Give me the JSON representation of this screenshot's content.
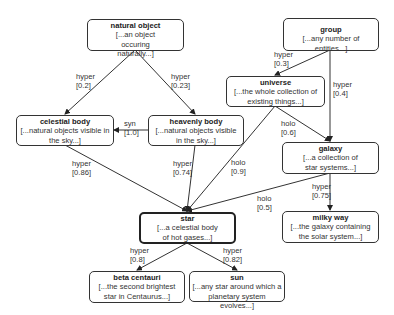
{
  "nodes": {
    "natural_object": {
      "title": "natural object",
      "gloss": "[...an object occuring naturally...]"
    },
    "celestial_body": {
      "title": "celestial body",
      "gloss": "[...natural objects visible in the sky...]"
    },
    "heavenly_body": {
      "title": "heavenly body",
      "gloss": "[...natural objects visible in the sky...]"
    },
    "group": {
      "title": "group",
      "gloss": "[...any number of entities...]"
    },
    "universe": {
      "title": "universe",
      "gloss": "[...the whole collection of existing things...]"
    },
    "galaxy": {
      "title": "galaxy",
      "gloss": "[...a collection of star systems...]"
    },
    "star": {
      "title": "star",
      "gloss": "[...a celestial body of hot gases...]"
    },
    "milky_way": {
      "title": "milky way",
      "gloss": "[...the galaxy containing the solar system...]"
    },
    "beta_centauri": {
      "title": "beta centauri",
      "gloss": "[...the second brightest star in Centaurus...]"
    },
    "sun": {
      "title": "sun",
      "gloss": "[...any star around which a planetary system evolves...]"
    }
  },
  "edges": [
    {
      "from": "natural object",
      "to": "celestial body",
      "relation": "hyper",
      "weight": "[0.2]"
    },
    {
      "from": "natural object",
      "to": "heavenly body",
      "relation": "hyper",
      "weight": "[0.23]"
    },
    {
      "from": "heavenly body",
      "to": "celestial body",
      "relation": "syn",
      "weight": "[1.0]"
    },
    {
      "from": "group",
      "to": "universe",
      "relation": "hyper",
      "weight": "[0.3]"
    },
    {
      "from": "group",
      "to": "galaxy",
      "relation": "hyper",
      "weight": "[0.4]"
    },
    {
      "from": "universe",
      "to": "galaxy",
      "relation": "holo",
      "weight": "[0.6]"
    },
    {
      "from": "universe",
      "to": "star",
      "relation": "holo",
      "weight": "[0.9]"
    },
    {
      "from": "celestial body",
      "to": "star",
      "relation": "hyper",
      "weight": "[0.86]"
    },
    {
      "from": "heavenly body",
      "to": "star",
      "relation": "hyper",
      "weight": "[0.74]"
    },
    {
      "from": "galaxy",
      "to": "star",
      "relation": "holo",
      "weight": "[0.5]"
    },
    {
      "from": "galaxy",
      "to": "milky way",
      "relation": "hyper",
      "weight": "[0.75]"
    },
    {
      "from": "star",
      "to": "beta centauri",
      "relation": "hyper",
      "weight": "[0.8]"
    },
    {
      "from": "star",
      "to": "sun",
      "relation": "hyper",
      "weight": "[0.82]"
    }
  ]
}
